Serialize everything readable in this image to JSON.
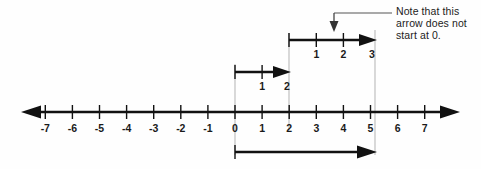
{
  "figure": {
    "background_color": "#fefefe",
    "ink_color": "#111111",
    "guide_color": "#b9b9b9"
  },
  "number_line": {
    "origin_x_px": 235,
    "unit_px": 27.1,
    "axis_y_px": 112,
    "min": -7.7,
    "max": 7.7,
    "tick_values": [
      -7,
      -6,
      -5,
      -4,
      -3,
      -2,
      -1,
      0,
      1,
      2,
      3,
      4,
      5,
      6,
      7
    ],
    "tick_labels": [
      "-7",
      "-6",
      "-5",
      "-4",
      "-3",
      "-2",
      "-1",
      "0",
      "1",
      "2",
      "3",
      "4",
      "5",
      "6",
      "7"
    ],
    "left_arrowhead": true,
    "right_arrowhead": true
  },
  "guides": [
    {
      "name": "guide-at-0",
      "value": 0,
      "top_px": 64,
      "bottom_px": 155
    },
    {
      "name": "guide-at-2",
      "value": 2,
      "top_px": 33,
      "bottom_px": 130
    },
    {
      "name": "guide-at-5",
      "value": 5,
      "top_px": 30,
      "bottom_px": 155
    }
  ],
  "vectors": [
    {
      "name": "first-vector",
      "from": 0,
      "to": 2,
      "y_px": 72,
      "length": 2,
      "step_labels": [
        "1",
        "2"
      ],
      "step_label_y_px": 86,
      "direction": "right"
    },
    {
      "name": "second-vector",
      "from": 2,
      "to": 5,
      "y_px": 40,
      "length": 3,
      "step_labels": [
        "1",
        "2",
        "3"
      ],
      "step_label_y_px": 54,
      "direction": "right"
    },
    {
      "name": "resultant-vector",
      "from": 0,
      "to": 5,
      "y_px": 152,
      "length": 5,
      "step_labels": [],
      "direction": "right"
    }
  ],
  "callout": {
    "name": "note-callout",
    "pointer_x_px": 334,
    "pointer_top_px": 13,
    "pointer_bottom_px": 31,
    "leader_from_x_px": 334,
    "leader_to_x_px": 392,
    "leader_y_px": 13,
    "lines": [
      "Note that this",
      "arrow does not",
      "start at 0."
    ]
  }
}
